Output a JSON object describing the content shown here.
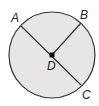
{
  "diagram": {
    "type": "circle",
    "center": {
      "label": "D",
      "x": 52,
      "y": 55
    },
    "radius": 43,
    "fill": "#e6e6e6",
    "stroke": "#333333",
    "points": [
      {
        "label": "A",
        "x": 21,
        "y": 26
      },
      {
        "label": "B",
        "x": 81,
        "y": 23
      },
      {
        "label": "C",
        "x": 81,
        "y": 85
      }
    ],
    "segments": [
      {
        "from": "A",
        "to": "C",
        "type": "diameter"
      },
      {
        "from": "D",
        "to": "B",
        "type": "radius"
      }
    ]
  }
}
